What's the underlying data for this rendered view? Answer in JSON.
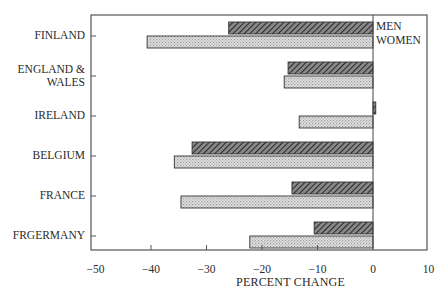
{
  "chart_data": {
    "type": "bar",
    "orientation": "horizontal",
    "title": "",
    "xlabel": "PERCENT CHANGE",
    "ylabel": "",
    "xlim": [
      -51,
      10
    ],
    "x_ticks": [
      -50,
      -40,
      -30,
      -20,
      -10,
      0,
      10
    ],
    "x_tick_labels": [
      "−50",
      "−40",
      "−30",
      "−20",
      "−10",
      "0",
      "10"
    ],
    "categories": [
      "FINLAND",
      "ENGLAND &\nWALES",
      "IRELAND",
      "BELGIUM",
      "FRANCE",
      "FRGERMANY"
    ],
    "series": [
      {
        "name": "MEN",
        "pattern": "diagonal-hatch",
        "values": [
          -26,
          -15.3,
          0.5,
          -32.6,
          -14.6,
          -10.6
        ]
      },
      {
        "name": "WOMEN",
        "pattern": "light-dotted",
        "values": [
          -40.7,
          -16.0,
          -13.3,
          -35.8,
          -34.6,
          -22.2
        ]
      }
    ],
    "legend": {
      "position": "inside-top-right, next to zero line",
      "entries": [
        "MEN",
        "WOMEN"
      ]
    },
    "grid": false
  },
  "colors": {
    "frame": "#555555",
    "men_fill": "#6a6a6a",
    "men_hatch": "#2a2a2a",
    "women_fill": "#d6d6d6",
    "women_dot": "#9a9a9a",
    "bar_outline": "#333333"
  }
}
